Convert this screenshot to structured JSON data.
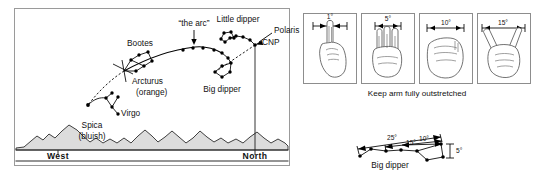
{
  "figure": {
    "panels": [
      "sky-chart",
      "hand-angles",
      "big-dipper-angles"
    ]
  },
  "sky_chart": {
    "labels": {
      "bootes": "Bootes",
      "arc": "“the arc”",
      "little_dipper": "Little dipper",
      "polaris": "Polaris",
      "cnp": "CNP",
      "big_dipper": "Big dipper",
      "arcturus": "Arcturus",
      "arcturus_color": "(orange)",
      "virgo": "Virgo",
      "spica": "Spica",
      "spica_color": "(bluish)",
      "west": "West",
      "north": "North"
    },
    "stars": {
      "bootes": [
        [
          123,
          70
        ],
        [
          131,
          60
        ],
        [
          139,
          55
        ],
        [
          148,
          52
        ],
        [
          152,
          61
        ],
        [
          144,
          66
        ],
        [
          136,
          71
        ]
      ],
      "arc": [
        [
          124,
          71
        ],
        [
          140,
          63
        ],
        [
          157,
          57
        ],
        [
          171,
          53
        ],
        [
          183,
          50
        ],
        [
          193,
          48
        ],
        [
          203,
          48
        ],
        [
          214,
          50
        ],
        [
          222,
          53
        ]
      ],
      "big_dipper": [
        [
          214,
          50
        ],
        [
          222,
          53
        ],
        [
          228,
          58
        ],
        [
          222,
          66
        ],
        [
          215,
          72
        ],
        [
          222,
          77
        ],
        [
          230,
          72
        ],
        [
          231,
          63
        ]
      ],
      "little_dipper": [
        [
          221,
          41
        ],
        [
          228,
          36
        ],
        [
          235,
          33
        ],
        [
          243,
          33
        ],
        [
          250,
          38
        ],
        [
          255,
          45
        ],
        [
          251,
          50
        ],
        [
          244,
          46
        ]
      ],
      "virgo": [
        [
          88,
          105
        ],
        [
          97,
          103
        ],
        [
          105,
          99
        ],
        [
          112,
          93
        ],
        [
          118,
          97
        ],
        [
          112,
          107
        ],
        [
          118,
          114
        ]
      ],
      "polaris_cnp": [
        255,
        45
      ],
      "spica": [
        88,
        105
      ],
      "arcturus": [
        124,
        71
      ]
    }
  },
  "hand_guide": {
    "caption": "Keep arm fully outstretched",
    "panels": [
      {
        "angle": "1°",
        "gesture": "index-finger-width",
        "name": "hand-panel-1deg"
      },
      {
        "angle": "5°",
        "gesture": "three-fingers",
        "name": "hand-panel-5deg"
      },
      {
        "angle": "10°",
        "gesture": "closed-fist",
        "name": "hand-panel-10deg"
      },
      {
        "angle": "15°",
        "gesture": "thumb-and-pinky-spread",
        "name": "hand-panel-15deg"
      }
    ]
  },
  "dipper_angles": {
    "label": "Big dipper",
    "measures": [
      "25°",
      "15°",
      "10°",
      "5°"
    ],
    "stars": [
      [
        360,
        156
      ],
      [
        371,
        149
      ],
      [
        386,
        151
      ],
      [
        401,
        150
      ],
      [
        417,
        151
      ],
      [
        427,
        160
      ],
      [
        441,
        144
      ],
      [
        443,
        157
      ]
    ]
  }
}
